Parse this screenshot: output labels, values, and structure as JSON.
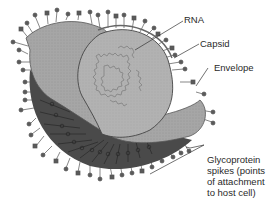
{
  "figure": {
    "labels": {
      "rna": "RNA",
      "capsid": "Capsid",
      "envelope": "Envelope",
      "spikes_line1": "Glycoprotein",
      "spikes_line2": "spikes (points",
      "spikes_line3": "of attachment",
      "spikes_line4": "to host cell)"
    },
    "colors": {
      "background": "#ffffff",
      "envelope_light": "#a9a9a9",
      "envelope_dark": "#4a4a4a",
      "capsid": "#b4b4b4",
      "rna": "#8a8a8a",
      "spike": "#555555",
      "leader": "#333333"
    }
  }
}
